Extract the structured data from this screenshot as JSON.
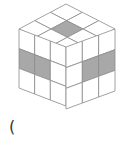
{
  "figure": {
    "type": "isometric-cube-3x3x3",
    "grid_size": 3,
    "line_color": "#8a8a8a",
    "face_color": "#ffffff",
    "shade_color": "#a8a8a8",
    "vertices": {
      "top": [
        66,
        4
      ],
      "left": [
        19,
        29
      ],
      "right": [
        115,
        29
      ],
      "front": [
        66,
        47
      ],
      "left_bottom": [
        19,
        88
      ],
      "right_bottom": [
        115,
        88
      ],
      "bottom": [
        66,
        109
      ]
    },
    "shaded": {
      "top": [
        [
          1,
          1
        ]
      ],
      "left": [
        [
          1,
          0
        ],
        [
          1,
          1
        ]
      ],
      "right": [
        [
          1,
          1
        ],
        [
          1,
          2
        ]
      ]
    }
  },
  "answer_prefix": "("
}
